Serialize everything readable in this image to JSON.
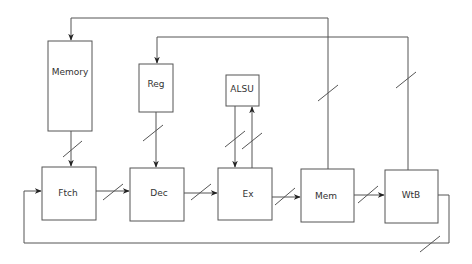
{
  "diagram": {
    "type": "pipeline-block-diagram",
    "colors": {
      "stroke": "#555555",
      "text": "#333333",
      "background": "#ffffff"
    },
    "blocks": {
      "memory": {
        "label": "Memory"
      },
      "reg": {
        "label": "Reg"
      },
      "alsu": {
        "label": "ALSU"
      },
      "ftch": {
        "label": "Ftch"
      },
      "dec": {
        "label": "Dec"
      },
      "ex": {
        "label": "Ex"
      },
      "mem": {
        "label": "Mem"
      },
      "wtb": {
        "label": "WtB"
      }
    },
    "connections": [
      {
        "from": "Memory",
        "to": "Ftch",
        "bus": true
      },
      {
        "from": "Reg",
        "to": "Dec",
        "bus": true
      },
      {
        "from": "ALSU",
        "to": "Ex",
        "bus": true
      },
      {
        "from": "Ex",
        "to": "ALSU",
        "bus": true
      },
      {
        "from": "Ftch",
        "to": "Dec",
        "bus": true
      },
      {
        "from": "Dec",
        "to": "Ex",
        "bus": true
      },
      {
        "from": "Ex",
        "to": "Mem",
        "bus": true
      },
      {
        "from": "Mem",
        "to": "WtB",
        "bus": true
      },
      {
        "from": "Mem",
        "to": "Memory",
        "bus": true
      },
      {
        "from": "WtB",
        "to": "Reg",
        "bus": true
      },
      {
        "from": "WtB",
        "to": "Ftch",
        "bus": true
      }
    ]
  }
}
